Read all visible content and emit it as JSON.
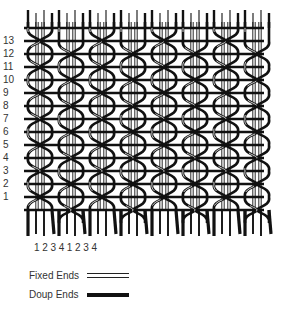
{
  "diagram": {
    "title": "",
    "type": "leno weave structure",
    "row_labels": [
      "13",
      "12",
      "11",
      "10",
      "9",
      "8",
      "7",
      "6",
      "5",
      "4",
      "3",
      "2",
      "1"
    ],
    "column_labels": [
      "1",
      "2",
      "3",
      "4",
      "1",
      "2",
      "3",
      "4"
    ],
    "legend": {
      "fixed": {
        "label": "Fixed Ends",
        "style": "double-line"
      },
      "doup": {
        "label": "Doup Ends",
        "style": "thick-line"
      }
    },
    "colors": {
      "ink": "#111111",
      "background": "#ffffff"
    }
  }
}
